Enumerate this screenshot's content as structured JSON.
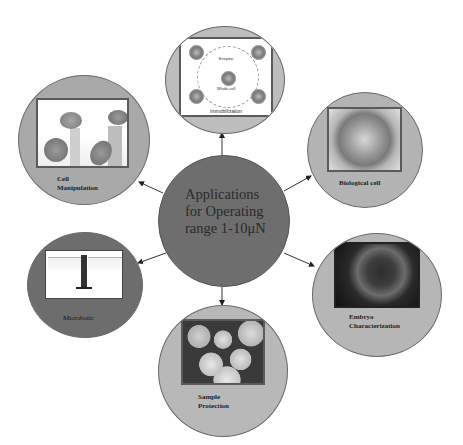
{
  "diagram": {
    "type": "hub-and-spoke",
    "hub": {
      "label": "Applications\nfor Operating\nrange 1-10μN",
      "color": "#6e6e6e",
      "cx": 224,
      "cy": 221,
      "r": 66
    },
    "nodes": [
      {
        "id": "immobilization",
        "label": "",
        "image_caption": "Immobilization",
        "image_sublabels": [
          "Enzyme",
          "Whole-cell"
        ],
        "cx": 225,
        "cy": 80,
        "rx": 60,
        "ry": 54,
        "fill": "#bdbdbd"
      },
      {
        "id": "cell-manipulation",
        "label": "Cell\nManipulation",
        "cx": 84,
        "cy": 140,
        "rx": 66,
        "ry": 65,
        "fill": "#a9a9a9"
      },
      {
        "id": "biological-cell",
        "label": "Biological cell",
        "cx": 365,
        "cy": 150,
        "rx": 58,
        "ry": 58,
        "fill": "#b3b3b3"
      },
      {
        "id": "microbotic",
        "label": "Microbotic",
        "cx": 85,
        "cy": 285,
        "rx": 58,
        "ry": 53,
        "fill": "#6d6d6d"
      },
      {
        "id": "sample-protection",
        "label": "Sample\nProtection",
        "cx": 223,
        "cy": 371,
        "rx": 65,
        "ry": 66,
        "fill": "#b8b8b8"
      },
      {
        "id": "embryo-characterization",
        "label": "Embryo\nCharacterization",
        "cx": 377,
        "cy": 295,
        "rx": 65,
        "ry": 62,
        "fill": "#b6b6b6"
      }
    ],
    "connectors": [
      {
        "to": "immobilization",
        "x1": 222,
        "y1": 156,
        "x2": 222,
        "y2": 133
      },
      {
        "to": "cell-manipulation",
        "x1": 163,
        "y1": 193,
        "x2": 139,
        "y2": 182
      },
      {
        "to": "biological-cell",
        "x1": 284,
        "y1": 191,
        "x2": 311,
        "y2": 176
      },
      {
        "to": "microbotic",
        "x1": 166,
        "y1": 253,
        "x2": 138,
        "y2": 263
      },
      {
        "to": "sample-protection",
        "x1": 222,
        "y1": 287,
        "x2": 222,
        "y2": 305
      },
      {
        "to": "embryo-characterization",
        "x1": 284,
        "y1": 253,
        "x2": 314,
        "y2": 266
      }
    ],
    "colors": {
      "connector": "#333333",
      "node_border": "#6a6a6a",
      "background": "#ffffff"
    }
  }
}
